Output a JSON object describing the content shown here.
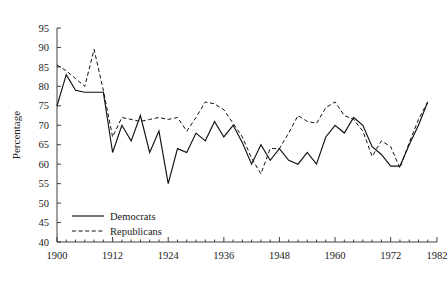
{
  "chart_data": {
    "type": "line",
    "title": "",
    "xlabel": "",
    "ylabel": "Percentage",
    "xlim": [
      1900,
      1982
    ],
    "ylim": [
      40,
      95
    ],
    "grid": false,
    "legend_position": "inside-bottom-left",
    "xticks": [
      1900,
      1912,
      1924,
      1936,
      1948,
      1960,
      1972,
      1982
    ],
    "xtick_labels": [
      "1900",
      "1912",
      "1924",
      "1936",
      "1948",
      "1960",
      "1972",
      "1982"
    ],
    "xminor_step": 2,
    "yticks": [
      40,
      45,
      50,
      55,
      60,
      65,
      70,
      75,
      80,
      85,
      90,
      95
    ],
    "ytick_labels": [
      "40",
      "45",
      "50",
      "55",
      "60",
      "65",
      "70",
      "75",
      "80",
      "85",
      "90",
      "95"
    ],
    "x": [
      1900,
      1902,
      1904,
      1906,
      1908,
      1910,
      1912,
      1914,
      1916,
      1918,
      1920,
      1922,
      1924,
      1926,
      1928,
      1930,
      1932,
      1934,
      1936,
      1938,
      1940,
      1942,
      1944,
      1946,
      1948,
      1950,
      1952,
      1954,
      1956,
      1958,
      1960,
      1962,
      1964,
      1966,
      1968,
      1970,
      1972,
      1974,
      1976,
      1978,
      1980
    ],
    "series": [
      {
        "name": "Democrats",
        "style": "solid",
        "values": [
          75,
          83,
          79,
          78.5,
          78.5,
          78.5,
          63,
          70,
          66,
          72.5,
          63,
          68.5,
          55,
          64,
          63,
          68,
          66,
          71,
          67,
          70,
          65.5,
          60,
          65,
          61,
          64,
          61,
          60,
          63,
          60,
          67,
          70,
          68,
          72,
          70,
          64.5,
          62.5,
          59.5,
          59.5,
          65,
          70,
          76
        ]
      },
      {
        "name": "Republicans",
        "style": "dashed",
        "values": [
          85.5,
          84,
          82,
          80,
          89.5,
          79,
          67,
          72,
          71.5,
          71,
          71.5,
          72,
          71.5,
          72,
          68.5,
          72,
          76,
          75.5,
          74,
          70.5,
          67,
          61.5,
          57.5,
          64,
          64,
          68,
          72.5,
          71,
          70.5,
          74.5,
          76,
          72.5,
          71.5,
          68.5,
          62,
          66,
          64.5,
          59,
          65.5,
          71.5,
          76
        ]
      }
    ],
    "legend": [
      {
        "label": "Democrats",
        "style": "solid"
      },
      {
        "label": "Republicans",
        "style": "dashed"
      }
    ]
  }
}
